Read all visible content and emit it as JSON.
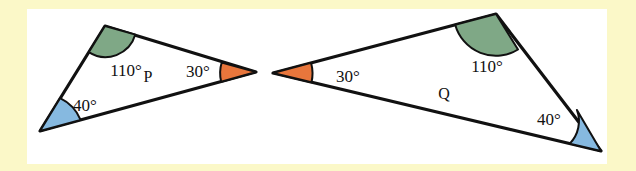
{
  "figure": {
    "canvas": {
      "width": 636,
      "height": 171
    },
    "background_color": "#ffffff",
    "frame_color": "#fbf8c8",
    "outline_color": "#111111",
    "text_color": "#111111"
  },
  "legend_colors": {
    "green_110": "#7fa886",
    "blue_40": "#86b9e0",
    "orange_30": "#e8763c"
  },
  "triangles": [
    {
      "name": "P",
      "label": "P",
      "label_position": {
        "x": 148,
        "y": 78
      },
      "vertices": {
        "top": {
          "x": 105,
          "y": 26
        },
        "left": {
          "x": 40,
          "y": 131
        },
        "right": {
          "x": 256,
          "y": 72
        }
      },
      "angles": [
        {
          "id": "p-110",
          "value": "110°",
          "vertex": "top",
          "color": "#7fa886",
          "label_position": {
            "x": 126,
            "y": 72
          }
        },
        {
          "id": "p-40",
          "value": "40°",
          "vertex": "left",
          "color": "#86b9e0",
          "label_position": {
            "x": 85,
            "y": 107
          }
        },
        {
          "id": "p-30",
          "value": "30°",
          "vertex": "right",
          "color": "#e8763c",
          "label_position": {
            "x": 198,
            "y": 73
          }
        }
      ]
    },
    {
      "name": "Q",
      "label": "Q",
      "label_position": {
        "x": 444,
        "y": 95
      },
      "vertices": {
        "top": {
          "x": 496,
          "y": 14
        },
        "left": {
          "x": 273,
          "y": 73
        },
        "right": {
          "x": 601,
          "y": 151
        }
      },
      "angles": [
        {
          "id": "q-30",
          "value": "30°",
          "vertex": "left",
          "color": "#e8763c",
          "label_position": {
            "x": 348,
            "y": 78
          }
        },
        {
          "id": "q-110",
          "value": "110°",
          "vertex": "top",
          "color": "#7fa886",
          "label_position": {
            "x": 487,
            "y": 68
          }
        },
        {
          "id": "q-40",
          "value": "40°",
          "vertex": "right",
          "color": "#86b9e0",
          "label_position": {
            "x": 549,
            "y": 121
          }
        }
      ]
    }
  ]
}
